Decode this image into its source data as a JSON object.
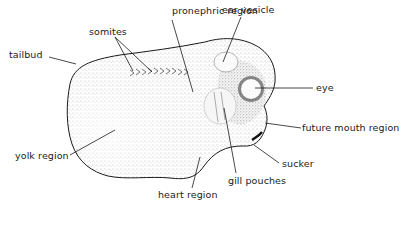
{
  "figure": {
    "type": "labeled anatomical diagram",
    "labels": {
      "pronephric_region": "pronephric region",
      "ear_vesicle": "ear vesicle",
      "somites": "somites",
      "tailbud": "tailbud",
      "eye": "eye",
      "future_mouth_region": "future mouth region",
      "yolk_region": "yolk region",
      "sucker": "sucker",
      "gill_pouches": "gill pouches",
      "heart_region": "heart region"
    },
    "colors": {
      "ink": "#1a1a1a",
      "stipple": "#6a6a6a",
      "background": "#ffffff"
    }
  }
}
